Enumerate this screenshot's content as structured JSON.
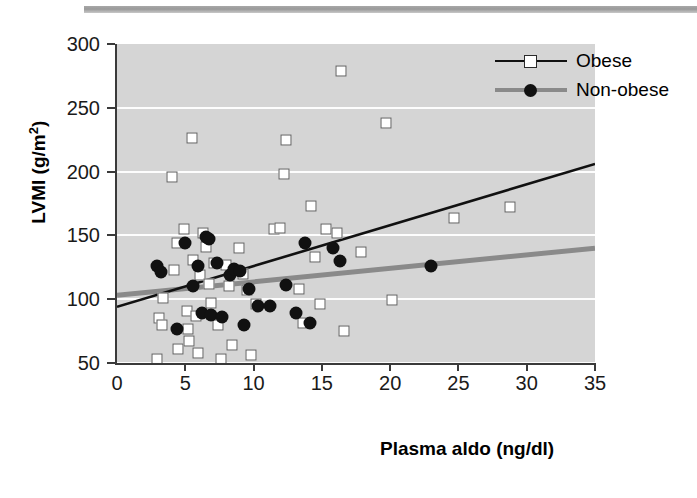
{
  "chart_data": {
    "type": "scatter",
    "title": "",
    "xlabel": "Plasma aldo (ng/dl)",
    "ylabel_text": "LVMI (g/m",
    "ylabel_sup": "2",
    "ylabel_tail": ")",
    "xlim": [
      0,
      35
    ],
    "ylim": [
      50,
      300
    ],
    "xticks": [
      0,
      5,
      10,
      15,
      20,
      25,
      30,
      35
    ],
    "yticks": [
      50,
      100,
      150,
      200,
      250,
      300
    ],
    "grid": "horizontal-white",
    "legend_position": "top-right",
    "plot_background": "#d5d5d5",
    "series": [
      {
        "name": "Obese",
        "marker": "open-square",
        "marker_color": "#ffffff",
        "marker_edge": "#5a5a5a",
        "line_color": "#111111",
        "fit_line": {
          "x": [
            0,
            35
          ],
          "y": [
            94,
            206
          ]
        },
        "points": [
          [
            2.9,
            53
          ],
          [
            3.1,
            85
          ],
          [
            3.3,
            80
          ],
          [
            3.4,
            101
          ],
          [
            4.0,
            196
          ],
          [
            4.2,
            123
          ],
          [
            4.4,
            144
          ],
          [
            4.5,
            61
          ],
          [
            4.9,
            155
          ],
          [
            5.1,
            91
          ],
          [
            5.2,
            77
          ],
          [
            5.3,
            67
          ],
          [
            5.5,
            226
          ],
          [
            5.6,
            131
          ],
          [
            5.8,
            87
          ],
          [
            5.9,
            58
          ],
          [
            6.1,
            119
          ],
          [
            6.3,
            152
          ],
          [
            6.5,
            141
          ],
          [
            6.7,
            112
          ],
          [
            6.9,
            97
          ],
          [
            7.1,
            128
          ],
          [
            7.4,
            80
          ],
          [
            7.6,
            53
          ],
          [
            8.0,
            127
          ],
          [
            8.2,
            110
          ],
          [
            8.4,
            64
          ],
          [
            8.9,
            140
          ],
          [
            9.2,
            120
          ],
          [
            9.5,
            107
          ],
          [
            9.8,
            56
          ],
          [
            10.2,
            96
          ],
          [
            11.5,
            155
          ],
          [
            11.9,
            156
          ],
          [
            12.2,
            198
          ],
          [
            12.4,
            225
          ],
          [
            13.3,
            108
          ],
          [
            13.6,
            81
          ],
          [
            14.2,
            173
          ],
          [
            14.5,
            133
          ],
          [
            14.9,
            96
          ],
          [
            15.3,
            155
          ],
          [
            16.1,
            152
          ],
          [
            16.4,
            279
          ],
          [
            16.6,
            75
          ],
          [
            17.9,
            137
          ],
          [
            19.7,
            238
          ],
          [
            20.1,
            99
          ],
          [
            24.7,
            164
          ],
          [
            28.8,
            172
          ]
        ]
      },
      {
        "name": "Non-obese",
        "marker": "filled-circle",
        "marker_color": "#111111",
        "line_color": "#8a8a8a",
        "fit_line": {
          "x": [
            0,
            35
          ],
          "y": [
            103,
            140
          ]
        },
        "points": [
          [
            2.9,
            126
          ],
          [
            3.2,
            121
          ],
          [
            4.4,
            77
          ],
          [
            5.0,
            144
          ],
          [
            5.6,
            110
          ],
          [
            5.9,
            126
          ],
          [
            6.2,
            89
          ],
          [
            6.5,
            149
          ],
          [
            6.7,
            147
          ],
          [
            6.9,
            88
          ],
          [
            7.3,
            128
          ],
          [
            7.7,
            86
          ],
          [
            8.3,
            119
          ],
          [
            8.6,
            124
          ],
          [
            9.0,
            122
          ],
          [
            9.3,
            80
          ],
          [
            9.7,
            108
          ],
          [
            10.3,
            95
          ],
          [
            11.2,
            95
          ],
          [
            12.4,
            111
          ],
          [
            13.1,
            89
          ],
          [
            13.8,
            144
          ],
          [
            14.1,
            81
          ],
          [
            15.8,
            140
          ],
          [
            16.3,
            130
          ],
          [
            23.0,
            126
          ]
        ]
      }
    ]
  },
  "legend": {
    "items": [
      {
        "label": "Obese",
        "marker": "open-square-with-line"
      },
      {
        "label": "Non-obese",
        "marker": "filled-circle-with-line"
      }
    ]
  }
}
